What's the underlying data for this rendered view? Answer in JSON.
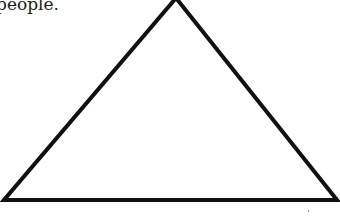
{
  "document": {
    "text_fragment": "people."
  },
  "figure": {
    "shape": "triangle",
    "stroke_color": "#111111",
    "fill_color": "#ffffff",
    "stroke_width": 4,
    "vertices": {
      "apex": [
        176,
        -2
      ],
      "bottom_left": [
        4,
        200
      ],
      "bottom_right": [
        337,
        200
      ]
    }
  }
}
